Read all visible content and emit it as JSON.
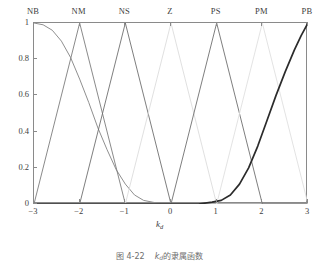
{
  "figure": {
    "caption_prefix": "图 4-22",
    "caption_var": "k",
    "caption_var_sub": "d",
    "caption_suffix": "的隶属函数"
  },
  "axes": {
    "x_title_var": "k",
    "x_title_sub": "d",
    "y_title": "隶属度",
    "x_ticks": [
      "-3",
      "-2",
      "-1",
      "0",
      "1",
      "2",
      "3"
    ],
    "y_ticks": [
      "0",
      "0.2",
      "0.4",
      "0.6",
      "0.8",
      "1"
    ],
    "top_labels": [
      "NB",
      "NM",
      "NS",
      "Z",
      "PS",
      "PM",
      "PB"
    ]
  },
  "chart_data": {
    "type": "line",
    "title": "",
    "xlabel": "k_d",
    "ylabel": "隶属度",
    "xlim": [
      -3,
      3
    ],
    "ylim": [
      0,
      1
    ],
    "xticks": [
      -3,
      -2,
      -1,
      0,
      1,
      2,
      3
    ],
    "yticks": [
      0,
      0.2,
      0.4,
      0.6,
      0.8,
      1
    ],
    "grid": false,
    "legend": "top-axis-labels",
    "top_axis_labels": [
      "NB",
      "NM",
      "NS",
      "Z",
      "PS",
      "PM",
      "PB"
    ],
    "top_axis_label_positions": [
      -3,
      -2,
      -1,
      0,
      1,
      2,
      3
    ],
    "series": [
      {
        "name": "NB",
        "shape": "gaussian-shoulder",
        "color": "#8f8f8f",
        "width": 1.0,
        "peak": -3,
        "points": [
          [
            -3,
            1.0
          ],
          [
            -2.8,
            0.99
          ],
          [
            -2.6,
            0.96
          ],
          [
            -2.4,
            0.9
          ],
          [
            -2.2,
            0.81
          ],
          [
            -2.0,
            0.69
          ],
          [
            -1.8,
            0.56
          ],
          [
            -1.6,
            0.42
          ],
          [
            -1.4,
            0.3
          ],
          [
            -1.2,
            0.19
          ],
          [
            -1.0,
            0.11
          ],
          [
            -0.8,
            0.05
          ],
          [
            -0.6,
            0.02
          ],
          [
            -0.4,
            0.01
          ],
          [
            -0.2,
            0.0
          ],
          [
            0,
            0.0
          ],
          [
            1,
            0.0
          ],
          [
            2,
            0.0
          ],
          [
            3,
            0.0
          ]
        ]
      },
      {
        "name": "NM",
        "shape": "triangle",
        "color": "#7d7d7d",
        "width": 0.9,
        "peak": -2,
        "points": [
          [
            -3,
            0.0
          ],
          [
            -2,
            1.0
          ],
          [
            -1,
            0.0
          ],
          [
            3,
            0.0
          ]
        ]
      },
      {
        "name": "NS",
        "shape": "triangle",
        "color": "#6f6f6f",
        "width": 0.9,
        "peak": -1,
        "points": [
          [
            -3,
            0.0
          ],
          [
            -2,
            0.0
          ],
          [
            -1,
            1.0
          ],
          [
            0,
            0.0
          ],
          [
            3,
            0.0
          ]
        ]
      },
      {
        "name": "Z",
        "shape": "triangle",
        "color": "#dcdcdc",
        "width": 0.9,
        "peak": 0,
        "points": [
          [
            -3,
            0.0
          ],
          [
            -1,
            0.0
          ],
          [
            0,
            1.0
          ],
          [
            1,
            0.0
          ],
          [
            3,
            0.0
          ]
        ]
      },
      {
        "name": "PS",
        "shape": "triangle",
        "color": "#6f6f6f",
        "width": 0.9,
        "peak": 1,
        "points": [
          [
            -3,
            0.0
          ],
          [
            0,
            0.0
          ],
          [
            1,
            1.0
          ],
          [
            2,
            0.0
          ],
          [
            3,
            0.0
          ]
        ]
      },
      {
        "name": "PM",
        "shape": "triangle",
        "color": "#e0e0e0",
        "width": 0.9,
        "peak": 2,
        "points": [
          [
            -3,
            0.0
          ],
          [
            1,
            0.0
          ],
          [
            2,
            1.0
          ],
          [
            3,
            0.0
          ]
        ]
      },
      {
        "name": "PB",
        "shape": "sigmoid-shoulder",
        "color": "#2b2b2b",
        "width": 1.7,
        "peak": 3,
        "points": [
          [
            -3,
            0.0
          ],
          [
            -2,
            0.0
          ],
          [
            -1,
            0.0
          ],
          [
            0,
            0.0
          ],
          [
            0.6,
            0.0
          ],
          [
            0.9,
            0.01
          ],
          [
            1.1,
            0.02
          ],
          [
            1.3,
            0.05
          ],
          [
            1.5,
            0.11
          ],
          [
            1.7,
            0.2
          ],
          [
            1.9,
            0.32
          ],
          [
            2.1,
            0.46
          ],
          [
            2.3,
            0.6
          ],
          [
            2.5,
            0.73
          ],
          [
            2.7,
            0.85
          ],
          [
            2.85,
            0.93
          ],
          [
            3,
            1.0
          ]
        ]
      }
    ]
  }
}
